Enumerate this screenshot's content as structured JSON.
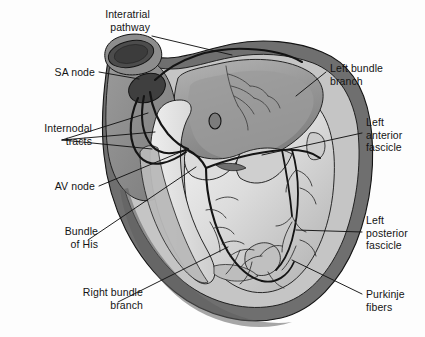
{
  "figure": {
    "type": "anatomical-illustration",
    "width": 425,
    "height": 337,
    "background_color": "#fdfdfd",
    "line_color": "#141414",
    "text_color": "#141414"
  },
  "palette": {
    "outer_myocardium_dark": "#6e6e6e",
    "myocardium_mid": "#8c8c8c",
    "chamber_wall_light": "#c9c9c9",
    "endocardium_pale": "#e4e4e4",
    "septum_white": "#f2f2f2",
    "lumen_dark": "#4a4a4a",
    "sa_node_dark": "#3f3f3f",
    "outline": "#141414"
  },
  "labels": [
    {
      "id": "interatrial-pathway",
      "lines": [
        "Interatrial",
        "pathway"
      ],
      "align": "right",
      "text_x": 150,
      "text_y": 8,
      "leader": {
        "x1": 152,
        "y1": 36,
        "x2": 232,
        "y2": 55
      }
    },
    {
      "id": "sa-node",
      "lines": [
        "SA node"
      ],
      "align": "right",
      "text_x": 95,
      "text_y": 66,
      "leader": {
        "x1": 99,
        "y1": 72,
        "x2": 139,
        "y2": 79
      }
    },
    {
      "id": "internodal-tracts",
      "lines": [
        "Internodal",
        "tracts"
      ],
      "align": "right",
      "text_x": 92,
      "text_y": 122,
      "leader_group": [
        {
          "x1": 62,
          "y1": 140,
          "x2": 148,
          "y2": 113
        },
        {
          "x1": 62,
          "y1": 140,
          "x2": 155,
          "y2": 132
        },
        {
          "x1": 62,
          "y1": 140,
          "x2": 152,
          "y2": 149
        }
      ]
    },
    {
      "id": "av-node",
      "lines": [
        "AV node"
      ],
      "align": "right",
      "text_x": 95,
      "text_y": 180,
      "leader": {
        "x1": 99,
        "y1": 186,
        "x2": 183,
        "y2": 151
      }
    },
    {
      "id": "bundle-of-his",
      "lines": [
        "Bundle",
        "of His"
      ],
      "align": "right",
      "text_x": 98,
      "text_y": 225,
      "leader": {
        "x1": 88,
        "y1": 240,
        "x2": 196,
        "y2": 167
      }
    },
    {
      "id": "right-bundle-branch",
      "lines": [
        "Right bundle",
        "branch"
      ],
      "align": "right",
      "text_x": 143,
      "text_y": 286,
      "leader": {
        "x1": 118,
        "y1": 302,
        "x2": 228,
        "y2": 247
      }
    },
    {
      "id": "left-bundle-branch",
      "lines": [
        "Left bundle",
        "branch"
      ],
      "align": "left",
      "text_x": 330,
      "text_y": 62,
      "leader": {
        "x1": 326,
        "y1": 72,
        "x2": 296,
        "y2": 96
      }
    },
    {
      "id": "left-anterior-fascicle",
      "lines": [
        "Left",
        "anterior",
        "fascicle"
      ],
      "align": "left",
      "text_x": 366,
      "text_y": 116,
      "leader": {
        "x1": 362,
        "y1": 133,
        "x2": 262,
        "y2": 155
      }
    },
    {
      "id": "left-posterior-fascicle",
      "lines": [
        "Left",
        "posterior",
        "fascicle"
      ],
      "align": "left",
      "text_x": 366,
      "text_y": 214,
      "leader": {
        "x1": 362,
        "y1": 232,
        "x2": 296,
        "y2": 230
      }
    },
    {
      "id": "purkinje-fibers",
      "lines": [
        "Purkinje",
        "fibers"
      ],
      "align": "left",
      "text_x": 366,
      "text_y": 288,
      "leader": {
        "x1": 362,
        "y1": 294,
        "x2": 292,
        "y2": 260
      }
    }
  ]
}
